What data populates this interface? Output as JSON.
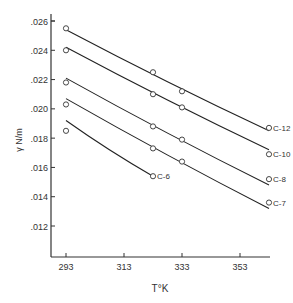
{
  "chart_data": {
    "type": "line",
    "title": "",
    "xlabel": "T°K",
    "ylabel": "γ N/m",
    "xlim": [
      288,
      367
    ],
    "ylim": [
      0.01,
      0.026
    ],
    "grid": false,
    "legend": "inline labels at right end of each curve",
    "x_ticks": [
      293,
      313,
      333,
      353
    ],
    "x_tick_labels": [
      "293",
      "313",
      "333",
      "353"
    ],
    "y_ticks": [
      0.012,
      0.014,
      0.016,
      0.018,
      0.02,
      0.022,
      0.024,
      0.026
    ],
    "y_tick_labels": [
      ".012",
      ".014",
      ".016",
      ".018",
      ".020",
      ".022",
      ".024",
      ".026"
    ],
    "series": [
      {
        "name": "C-12",
        "points": [
          [
            293,
            0.0255
          ],
          [
            323,
            0.0225
          ],
          [
            333,
            0.0212
          ],
          [
            363,
            0.0187
          ]
        ],
        "fit": [
          [
            293,
            0.0254
          ],
          [
            363,
            0.0185
          ]
        ]
      },
      {
        "name": "C-10",
        "points": [
          [
            293,
            0.024
          ],
          [
            323,
            0.021
          ],
          [
            333,
            0.0201
          ],
          [
            363,
            0.0169
          ]
        ],
        "fit": [
          [
            293,
            0.0242
          ],
          [
            363,
            0.0172
          ]
        ]
      },
      {
        "name": "C-8",
        "points": [
          [
            293,
            0.0218
          ],
          [
            323,
            0.0188
          ],
          [
            333,
            0.0179
          ],
          [
            363,
            0.0152
          ]
        ],
        "fit": [
          [
            293,
            0.0221
          ],
          [
            363,
            0.0148
          ]
        ]
      },
      {
        "name": "C-7",
        "points": [
          [
            293,
            0.0203
          ],
          [
            323,
            0.0173
          ],
          [
            333,
            0.0164
          ],
          [
            363,
            0.0136
          ]
        ],
        "fit": [
          [
            293,
            0.0207
          ],
          [
            363,
            0.0132
          ]
        ]
      },
      {
        "name": "C-6",
        "points": [
          [
            293,
            0.0185
          ],
          [
            323,
            0.0154
          ]
        ],
        "fit": [
          [
            293,
            0.0192
          ],
          [
            323,
            0.0154
          ]
        ]
      }
    ]
  }
}
